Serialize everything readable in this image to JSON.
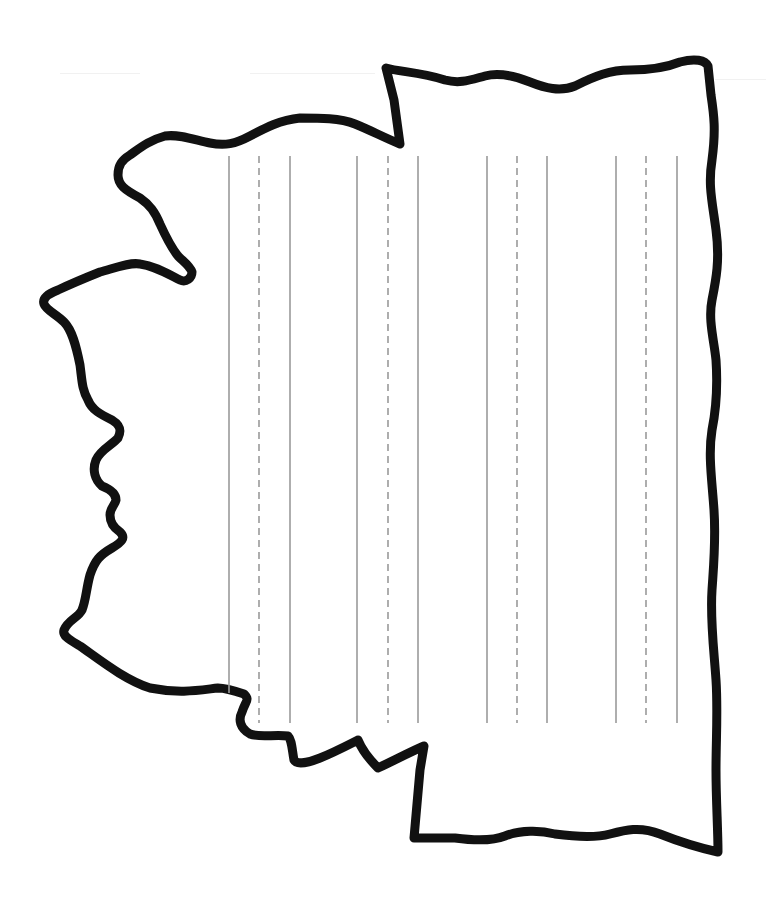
{
  "worksheet": {
    "type": "state-outline-writing-page",
    "orientation": "rotated-90",
    "outline": {
      "stroke_color": "#111111",
      "stroke_width": 9,
      "fill": "#ffffff"
    },
    "writing_guides": {
      "line_color": "#9a9a9a",
      "solid_width": 1.6,
      "dashed_width": 1.6,
      "dash_pattern": "7 5",
      "top_y": 156,
      "bottom_y": 723,
      "groups": [
        {
          "solid_a_x": 229,
          "dashed_x": 259,
          "solid_b_x": 290
        },
        {
          "solid_a_x": 357,
          "dashed_x": 388,
          "solid_b_x": 418
        },
        {
          "solid_a_x": 487,
          "dashed_x": 517,
          "solid_b_x": 547
        },
        {
          "solid_a_x": 616,
          "dashed_x": 646,
          "solid_b_x": 677
        }
      ]
    },
    "colors": {
      "background": "#ffffff",
      "outline": "#111111",
      "guide": "#9a9a9a"
    }
  }
}
